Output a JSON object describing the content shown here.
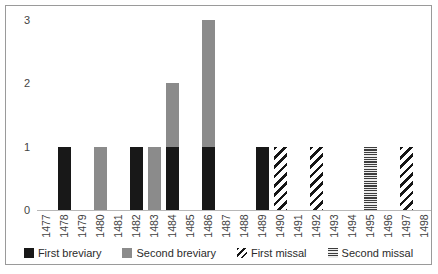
{
  "chart_data": {
    "type": "bar",
    "stacked": true,
    "title": "",
    "xlabel": "",
    "ylabel": "",
    "categories": [
      "1477",
      "1478",
      "1479",
      "1480",
      "1481",
      "1482",
      "1483",
      "1484",
      "1485",
      "1486",
      "1487",
      "1488",
      "1489",
      "1490",
      "1491",
      "1492",
      "1493",
      "1494",
      "1495",
      "1496",
      "1497",
      "1498"
    ],
    "series": [
      {
        "name": "First breviary",
        "pattern": "solid-black",
        "color": "#181818",
        "values": [
          0,
          1,
          0,
          0,
          0,
          1,
          0,
          1,
          0,
          1,
          0,
          0,
          1,
          0,
          0,
          0,
          0,
          0,
          0,
          0,
          0,
          0
        ]
      },
      {
        "name": "Second breviary",
        "pattern": "solid-gray",
        "color": "#8b8b8b",
        "values": [
          0,
          0,
          0,
          1,
          0,
          0,
          1,
          1,
          0,
          2,
          0,
          0,
          0,
          0,
          0,
          0,
          0,
          0,
          0,
          0,
          0,
          0
        ]
      },
      {
        "name": "First missal",
        "pattern": "diagonal-stripes",
        "color": "#161616",
        "values": [
          0,
          0,
          0,
          0,
          0,
          0,
          0,
          0,
          0,
          0,
          0,
          0,
          0,
          1,
          0,
          1,
          0,
          0,
          0,
          0,
          1,
          0
        ]
      },
      {
        "name": "Second missal",
        "pattern": "horizontal-stripes",
        "color": "#3d3d3d",
        "values": [
          0,
          0,
          0,
          0,
          0,
          0,
          0,
          0,
          0,
          0,
          0,
          0,
          0,
          0,
          0,
          0,
          0,
          0,
          1,
          0,
          0,
          0
        ]
      }
    ],
    "yticks": [
      "0",
      "1",
      "2",
      "3"
    ],
    "ylim": [
      0,
      3
    ],
    "grid": false,
    "legend_position": "bottom"
  },
  "colors": {
    "frame_border": "#9a9a9a",
    "axis_line": "#b7b7b7",
    "tick_label": "#404040",
    "legend_label": "#2b2b2b",
    "background": "#ffffff"
  }
}
